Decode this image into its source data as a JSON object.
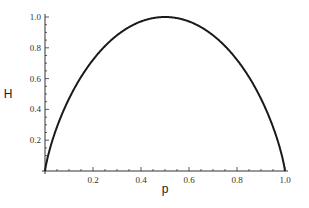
{
  "chart_data": {
    "type": "line",
    "title": "",
    "xlabel": "p",
    "ylabel": "H",
    "xlim": [
      0,
      1
    ],
    "ylim": [
      0,
      1
    ],
    "grid": false,
    "legend": null,
    "x_ticks": [
      "0.2",
      "0.4",
      "0.6",
      "0.8",
      "1.0"
    ],
    "y_ticks": [
      "0.2",
      "0.4",
      "0.6",
      "0.8",
      "1.0"
    ],
    "series": [
      {
        "name": "Binary entropy H(p)",
        "x": [
          0,
          0.05,
          0.1,
          0.15,
          0.2,
          0.25,
          0.3,
          0.35,
          0.4,
          0.45,
          0.5,
          0.55,
          0.6,
          0.65,
          0.7,
          0.75,
          0.8,
          0.85,
          0.9,
          0.95,
          1.0
        ],
        "values": [
          0,
          0.286,
          0.469,
          0.61,
          0.722,
          0.811,
          0.881,
          0.934,
          0.971,
          0.993,
          1.0,
          0.993,
          0.971,
          0.934,
          0.881,
          0.811,
          0.722,
          0.61,
          0.469,
          0.286,
          0
        ],
        "color": "#1a1a1a"
      }
    ]
  },
  "colors": {
    "line": "#1a1a1a",
    "axis": "#333333"
  }
}
